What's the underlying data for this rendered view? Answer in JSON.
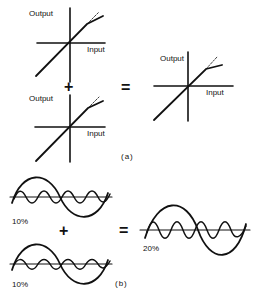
{
  "panel_a": {
    "caption": "(a)",
    "graphs": [
      {
        "y_label": "Output",
        "x_label": "Input"
      },
      {
        "y_label": "Output",
        "x_label": "Input"
      },
      {
        "y_label": "Output",
        "x_label": "Input"
      }
    ],
    "plus": "+",
    "equals": "="
  },
  "panel_b": {
    "caption": "(b)",
    "waves": [
      {
        "label": "10%"
      },
      {
        "label": "10%"
      },
      {
        "label": "20%"
      }
    ],
    "plus": "+",
    "equals": "="
  },
  "colors": {
    "ink": "#111111",
    "background": "#ffffff"
  }
}
